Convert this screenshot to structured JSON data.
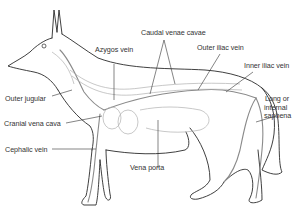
{
  "diagram": {
    "colors": {
      "outline": "#2a2a2a",
      "vein": "#8a8a8a",
      "detail": "#b0b0b0",
      "label": "#333333",
      "background": "#ffffff"
    },
    "labels": [
      {
        "id": "caudal-venae-cavae",
        "text": "Caudal venae cavae"
      },
      {
        "id": "azygos-vein",
        "text": "Azygos vein"
      },
      {
        "id": "outer-iliac-vein",
        "text": "Outer iliac vein"
      },
      {
        "id": "inner-iliac-vein",
        "text": "Inner iliac vein"
      },
      {
        "id": "outer-jugular",
        "text": "Outer jugular"
      },
      {
        "id": "long-saphena-line1",
        "text": "Long or"
      },
      {
        "id": "long-saphena-line2",
        "text": "internal"
      },
      {
        "id": "long-saphena-line3",
        "text": "saphena"
      },
      {
        "id": "cranial-vena-cava",
        "text": "Cranial vena cava"
      },
      {
        "id": "cephalic-vein",
        "text": "Cephalic vein"
      },
      {
        "id": "vena-porta",
        "text": "Vena porta"
      }
    ]
  }
}
